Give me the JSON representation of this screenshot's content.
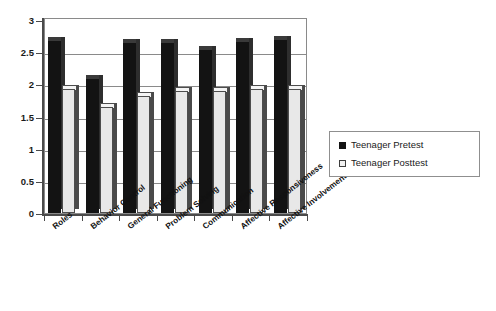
{
  "chart_data": {
    "type": "bar",
    "title": "",
    "subtitle": "",
    "xlabel": "",
    "ylabel": "",
    "ylim": [
      0,
      3
    ],
    "ytick_labels": [
      "0",
      "0.5",
      "1",
      "1.5",
      "2",
      "2.5",
      "3"
    ],
    "ytick_values": [
      0,
      0.5,
      1,
      1.5,
      2,
      2.5,
      3
    ],
    "grid": true,
    "legend_position": "right",
    "categories": [
      "Roles",
      "Behavior Control",
      "General Functioning",
      "Problem Solving",
      "Communication",
      "Affective Responsiveness",
      "Affective Involvement"
    ],
    "series": [
      {
        "name": "Teenager Pretest",
        "color": "#131313",
        "values": [
          2.68,
          2.09,
          2.64,
          2.65,
          2.53,
          2.66,
          2.69
        ]
      },
      {
        "name": "Teenager Posttest",
        "color": "#e8e8e8",
        "values": [
          1.92,
          1.65,
          1.82,
          1.9,
          1.9,
          1.92,
          1.93
        ]
      }
    ]
  },
  "legend": {
    "items": [
      {
        "label": "Teenager Pretest",
        "swatch": "black-square"
      },
      {
        "label": "Teenager Posttest",
        "swatch": "white-square"
      }
    ]
  }
}
